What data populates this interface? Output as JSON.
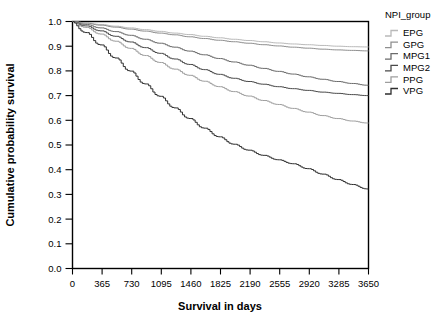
{
  "chart_data": {
    "type": "line",
    "title": "",
    "xlabel": "Survival in days",
    "ylabel": "Cumulative probability survival",
    "xlim": [
      0,
      3650
    ],
    "ylim": [
      0.0,
      1.0
    ],
    "grid": false,
    "legend_position": "right",
    "legend_title": "NPI_group",
    "xticks": [
      0,
      365,
      730,
      1095,
      1460,
      1825,
      2190,
      2555,
      2920,
      3285,
      3650
    ],
    "xtick_labels": [
      "0",
      "365",
      "730",
      "1095",
      "1460",
      "1825",
      "2190",
      "2555",
      "2920",
      "3285",
      "3650"
    ],
    "yticks": [
      0.0,
      0.1,
      0.2,
      0.3,
      0.4,
      0.5,
      0.6,
      0.7,
      0.8,
      0.9,
      1.0
    ],
    "ytick_labels": [
      "0.0",
      "0.1",
      "0.2",
      "0.3",
      "0.4",
      "0.5",
      "0.6",
      "0.7",
      "0.8",
      "0.9",
      "1.0"
    ],
    "x": [
      0,
      182,
      365,
      548,
      730,
      913,
      1095,
      1278,
      1460,
      1643,
      1825,
      2008,
      2190,
      2373,
      2555,
      2738,
      2920,
      3103,
      3285,
      3468,
      3650
    ],
    "series": [
      {
        "name": "EPG",
        "color": "#b9b9b9",
        "values": [
          1.0,
          0.995,
          0.988,
          0.981,
          0.974,
          0.967,
          0.96,
          0.953,
          0.947,
          0.94,
          0.934,
          0.928,
          0.923,
          0.918,
          0.913,
          0.909,
          0.906,
          0.903,
          0.9,
          0.898,
          0.897
        ]
      },
      {
        "name": "GPG",
        "color": "#8f8f8f",
        "values": [
          1.0,
          0.993,
          0.985,
          0.977,
          0.969,
          0.961,
          0.953,
          0.946,
          0.938,
          0.931,
          0.924,
          0.918,
          0.912,
          0.906,
          0.901,
          0.896,
          0.892,
          0.888,
          0.885,
          0.883,
          0.881
        ]
      },
      {
        "name": "MPG1",
        "color": "#6b6b6b",
        "values": [
          1.0,
          0.988,
          0.974,
          0.959,
          0.944,
          0.928,
          0.912,
          0.896,
          0.88,
          0.865,
          0.85,
          0.836,
          0.823,
          0.81,
          0.798,
          0.787,
          0.776,
          0.766,
          0.757,
          0.749,
          0.742
        ]
      },
      {
        "name": "MPG2",
        "color": "#4a4a4a",
        "values": [
          1.0,
          0.982,
          0.962,
          0.94,
          0.917,
          0.894,
          0.871,
          0.848,
          0.826,
          0.805,
          0.786,
          0.77,
          0.757,
          0.746,
          0.736,
          0.728,
          0.721,
          0.714,
          0.709,
          0.704,
          0.7
        ]
      },
      {
        "name": "PPG",
        "color": "#9e9e9e",
        "values": [
          1.0,
          0.976,
          0.949,
          0.92,
          0.891,
          0.862,
          0.834,
          0.807,
          0.782,
          0.758,
          0.736,
          0.716,
          0.698,
          0.68,
          0.664,
          0.648,
          0.633,
          0.619,
          0.607,
          0.597,
          0.589
        ]
      },
      {
        "name": "VPG",
        "color": "#2e2e2e",
        "values": [
          1.0,
          0.955,
          0.905,
          0.852,
          0.799,
          0.747,
          0.697,
          0.65,
          0.607,
          0.568,
          0.533,
          0.503,
          0.479,
          0.458,
          0.44,
          0.424,
          0.404,
          0.382,
          0.36,
          0.34,
          0.322
        ]
      }
    ]
  },
  "axes": {
    "x_title": "Survival in days",
    "y_title": "Cumulative probability survival"
  },
  "legend": {
    "title": "NPI_group",
    "items": [
      {
        "label": "EPG"
      },
      {
        "label": "GPG"
      },
      {
        "label": "MPG1"
      },
      {
        "label": "MPG2"
      },
      {
        "label": "PPG"
      },
      {
        "label": "VPG"
      }
    ]
  }
}
